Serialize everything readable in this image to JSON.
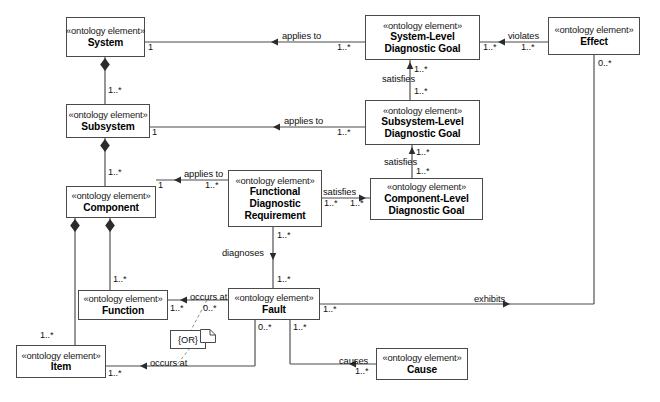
{
  "diagram": {
    "stereotype": "«ontology element»",
    "classes": [
      {
        "id": "system",
        "name": "System",
        "lines": [
          "System"
        ]
      },
      {
        "id": "subsystem",
        "name": "Subsystem",
        "lines": [
          "Subsystem"
        ]
      },
      {
        "id": "component",
        "name": "Component",
        "lines": [
          "Component"
        ]
      },
      {
        "id": "function",
        "name": "Function",
        "lines": [
          "Function"
        ]
      },
      {
        "id": "item",
        "name": "Item",
        "lines": [
          "Item"
        ]
      },
      {
        "id": "fdr",
        "name": "Functional Diagnostic Requirement",
        "lines": [
          "Functional",
          "Diagnostic",
          "Requirement"
        ]
      },
      {
        "id": "fault",
        "name": "Fault",
        "lines": [
          "Fault"
        ]
      },
      {
        "id": "cause",
        "name": "Cause",
        "lines": [
          "Cause"
        ]
      },
      {
        "id": "sysgoal",
        "name": "System-Level Diagnostic Goal",
        "lines": [
          "System-Level",
          "Diagnostic Goal"
        ]
      },
      {
        "id": "subgoal",
        "name": "Subsystem-Level Diagnostic Goal",
        "lines": [
          "Subsystem-Level",
          "Diagnostic Goal"
        ]
      },
      {
        "id": "compgoal",
        "name": "Component-Level Diagnostic Goal",
        "lines": [
          "Component-Level",
          "Diagnostic Goal"
        ]
      },
      {
        "id": "effect",
        "name": "Effect",
        "lines": [
          "Effect"
        ]
      }
    ],
    "associations": [
      {
        "id": "system-applies-to-sysgoal",
        "label": "applies to",
        "arrow": "left",
        "source_mult": "1",
        "target_mult": "1..*"
      },
      {
        "id": "subsystem-applies-to-subgoal",
        "label": "applies to",
        "arrow": "left",
        "source_mult": "1",
        "target_mult": "1..*"
      },
      {
        "id": "component-applies-to-fdr",
        "label": "applies to",
        "arrow": "left",
        "source_mult": "1",
        "target_mult": "1..*"
      },
      {
        "id": "fdr-satisfies-compgoal",
        "label": "satisfies",
        "arrow": "right",
        "source_mult": "1..*",
        "target_mult": "1..*"
      },
      {
        "id": "subgoal-satisfies-sysgoal",
        "label": "satisfies",
        "arrow": "up",
        "source_mult": "1..*",
        "target_mult": "1..*"
      },
      {
        "id": "compgoal-satisfies-subgoal",
        "label": "satisfies",
        "arrow": "up",
        "source_mult": "1..*",
        "target_mult": "1..*"
      },
      {
        "id": "sysgoal-violates-effect",
        "label": "violates",
        "arrow": "left",
        "source_mult": "1..*",
        "target_mult": "1..*"
      },
      {
        "id": "fdr-diagnoses-fault",
        "label": "diagnoses",
        "arrow": "down",
        "source_mult": "1..*",
        "target_mult": "1..*"
      },
      {
        "id": "fault-occurs-at-function",
        "label": "occurs at",
        "arrow": "left",
        "source_mult": "0..*",
        "target_mult": "1..*"
      },
      {
        "id": "fault-occurs-at-item",
        "label": "occurs at",
        "arrow": "left",
        "source_mult": "0..*",
        "target_mult": "1..*"
      },
      {
        "id": "fault-causes-cause",
        "label": "causes",
        "arrow": "left",
        "source_mult": "1..*",
        "target_mult": "1..*"
      },
      {
        "id": "fault-exhibits-effect",
        "label": "exhibits",
        "arrow": "right",
        "source_mult": "1..*",
        "target_mult": "0..*"
      },
      {
        "id": "system-composed-of-subsystem",
        "label": "",
        "arrow": "composition",
        "source_mult": "",
        "target_mult": "1..*"
      },
      {
        "id": "subsystem-composed-of-component",
        "label": "",
        "arrow": "composition",
        "source_mult": "",
        "target_mult": "1..*"
      },
      {
        "id": "component-composed-of-function",
        "label": "",
        "arrow": "composition",
        "source_mult": "",
        "target_mult": "1..*"
      },
      {
        "id": "component-composed-of-item",
        "label": "",
        "arrow": "composition",
        "source_mult": "",
        "target_mult": "1..*"
      }
    ],
    "notes": [
      {
        "id": "or-constraint",
        "text": "{OR}"
      }
    ],
    "multiplicity_labels": {
      "one": "1",
      "one_or_more": "1..*",
      "zero_or_more": "0..*"
    },
    "colors": {
      "line": "#4a4a4a",
      "text": "#111111",
      "background": "#ffffff"
    }
  }
}
